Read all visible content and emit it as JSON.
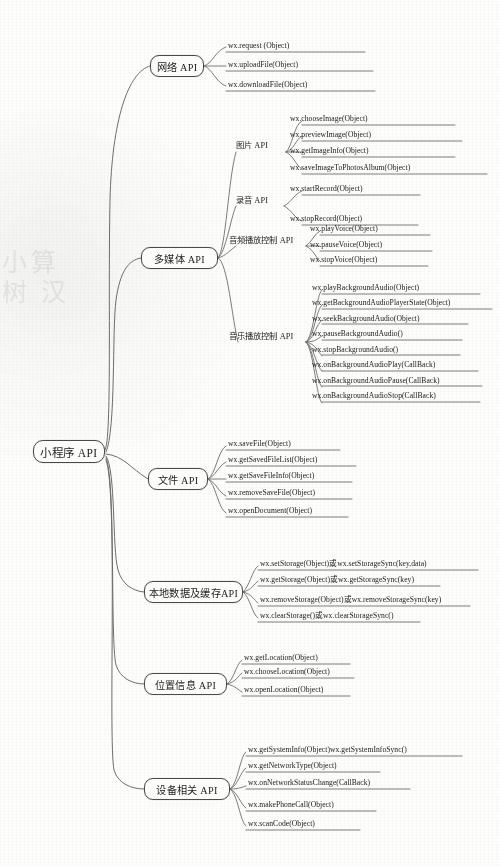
{
  "diagram": {
    "type": "mindmap",
    "root": {
      "label": "小程序 API"
    },
    "colors": {
      "background": "#fdfdfc",
      "node_border": "#4a4a4a",
      "node_fill": "#fcfcfb",
      "branch_line": "#6d6d6d",
      "text": "#1d1d1d"
    }
  },
  "branches": [
    {
      "id": "network",
      "label": "网络 API",
      "items": [
        "wx.request (Object)",
        "wx.uploadFile(Object)",
        "wx.downloadFile(Object)"
      ]
    },
    {
      "id": "multimedia",
      "label": "多媒体 API",
      "subgroups": [
        {
          "id": "image",
          "label": "图片 API",
          "items": [
            "wx.chooseImage(Object)",
            "wx.previewImage(Object)",
            "wx.getImageInfo(Object)",
            "wx.saveImageToPhotosAlbum(Object)"
          ]
        },
        {
          "id": "record",
          "label": "录音 API",
          "items": [
            "wx.startRecord(Object)",
            "wx.stopRecord(Object)"
          ]
        },
        {
          "id": "audio-playback",
          "label": "音频播放控制 API",
          "items": [
            "wx.playVoice(Object)",
            "wx.pauseVoice(Object)",
            "wx.stopVoice(Object)"
          ]
        },
        {
          "id": "music-playback",
          "label": "音乐播放控制 API",
          "items": [
            "wx.playBackgroundAudio(Object)",
            "wx.getBackgroundAudioPlayerState(Object)",
            "wx.seekBackgroundAudio(Object)",
            "wx.pauseBackgroundAudio()",
            "wx.stopBackgroundAudio()",
            "wx.onBackgroundAudioPlay(CallBack)",
            "wx.onBackgroundAudioPause(CallBack)",
            "wx.onBackgroundAudioStop(CallBack)"
          ]
        }
      ]
    },
    {
      "id": "file",
      "label": "文件 API",
      "items": [
        "wx.saveFile(Object)",
        "wx.getSavedFileList(Object)",
        "wx.getSaveFileInfo(Object)",
        "wx.removeSaveFile(Object)",
        "wx.openDocument(Object)"
      ]
    },
    {
      "id": "storage",
      "label": "本地数据及缓存API",
      "items": [
        "wx.setStorage(Object)或wx.setStorageSync(key,data)",
        "wx.getStorage(Object)或wx.getStorageSync(key)",
        "wx.removeStorage(Object)或wx.removeStorageSync(key)",
        "wx.clearStorage()或wx.clearStorageSync()"
      ]
    },
    {
      "id": "location",
      "label": "位置信息 API",
      "items": [
        "wx.getLocation(Object)",
        "wx.chooseLocation(Object)",
        "wx.openLocation(Object)"
      ]
    },
    {
      "id": "device",
      "label": "设备相关 API",
      "items": [
        "wx.getSystemInfo(Object)wx.getSystemInfoSync()",
        "wx.getNetworkType(Object)",
        "wx.onNetworkStatusChange(CallBack)",
        "wx.makePhoneCall(Object)",
        "wx.scanCode(Object)"
      ]
    }
  ],
  "watermark": {
    "left_text": "小算\n树 汉"
  }
}
